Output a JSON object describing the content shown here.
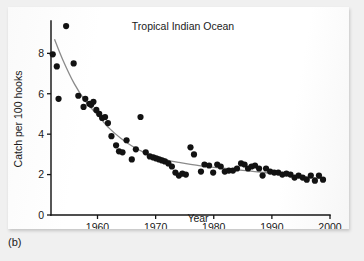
{
  "figure": {
    "caption": "(b)"
  },
  "chart_data": {
    "type": "scatter",
    "title": "Tropical Indian Ocean",
    "xlabel": "Year",
    "ylabel": "Catch per 100  hooks",
    "xlim": [
      1952,
      2000
    ],
    "ylim": [
      0,
      9.6
    ],
    "grid": false,
    "legend": null,
    "xticks": [
      1960,
      1970,
      1980,
      1990,
      2000
    ],
    "xtick_labels": [
      "1960",
      "1970",
      "1980",
      "1990",
      "2000"
    ],
    "yticks": [
      0,
      2,
      4,
      6,
      8
    ],
    "ytick_labels": [
      "0",
      "2",
      "4",
      "6",
      "8"
    ],
    "series": [
      {
        "name": "Catch rate observations",
        "marker": "filled-circle",
        "color": "#121212",
        "x": [
          1952.3,
          1953.0,
          1953.3,
          1954.6,
          1955.9,
          1956.7,
          1957.6,
          1957.9,
          1958.6,
          1958.9,
          1959.3,
          1959.8,
          1960.3,
          1960.8,
          1961.3,
          1961.8,
          1962.4,
          1963.2,
          1963.7,
          1964.3,
          1965.0,
          1965.9,
          1966.6,
          1967.4,
          1968.3,
          1969.0,
          1969.6,
          1970.1,
          1970.6,
          1971.1,
          1971.6,
          1972.2,
          1972.8,
          1973.4,
          1974.0,
          1974.6,
          1975.2,
          1976.0,
          1976.6,
          1977.8,
          1978.4,
          1979.2,
          1979.9,
          1980.6,
          1981.2,
          1981.9,
          1982.6,
          1983.3,
          1984.0,
          1984.7,
          1985.3,
          1985.9,
          1986.5,
          1987.1,
          1987.8,
          1988.4,
          1989.0,
          1989.7,
          1990.4,
          1991.1,
          1991.8,
          1992.5,
          1993.2,
          1993.9,
          1994.6,
          1995.3,
          1996.0,
          1996.7,
          1997.4,
          1998.1,
          1998.8
        ],
        "y": [
          7.95,
          7.35,
          5.75,
          9.35,
          7.5,
          5.9,
          5.35,
          5.75,
          5.5,
          5.45,
          5.6,
          5.2,
          5.0,
          4.8,
          4.85,
          4.55,
          3.9,
          3.45,
          3.15,
          3.1,
          3.7,
          2.75,
          3.25,
          4.85,
          3.1,
          2.9,
          2.85,
          2.8,
          2.75,
          2.7,
          2.65,
          2.55,
          2.4,
          2.1,
          1.95,
          2.05,
          2.0,
          3.35,
          3.0,
          2.15,
          2.5,
          2.45,
          2.1,
          2.5,
          2.4,
          2.15,
          2.2,
          2.2,
          2.3,
          2.55,
          2.5,
          2.3,
          2.4,
          2.45,
          2.3,
          1.95,
          2.3,
          2.15,
          2.1,
          2.1,
          2.0,
          2.05,
          2.0,
          1.85,
          1.95,
          1.85,
          1.75,
          1.95,
          1.7,
          1.95,
          1.75
        ]
      }
    ],
    "fit_curve": {
      "name": "fitted decline curve",
      "color": "#8a8a8a",
      "x": [
        1952.6,
        1954,
        1956,
        1958,
        1960,
        1962,
        1964,
        1966,
        1968,
        1970,
        1972,
        1974,
        1976,
        1978,
        1980,
        1982,
        1984,
        1986,
        1988,
        1990,
        1992,
        1994,
        1996,
        1998,
        1998.8
      ],
      "y": [
        8.7,
        7.7,
        6.5,
        5.6,
        4.95,
        4.3,
        3.8,
        3.4,
        3.1,
        2.9,
        2.72,
        2.6,
        2.5,
        2.42,
        2.36,
        2.3,
        2.24,
        2.18,
        2.12,
        2.06,
        2.0,
        1.94,
        1.88,
        1.82,
        1.8
      ]
    }
  }
}
